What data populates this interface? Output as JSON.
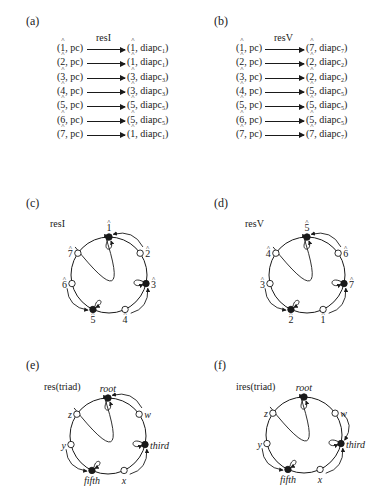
{
  "panels": {
    "a": {
      "label": "(a)",
      "title": "resI",
      "rows": [
        {
          "src": "1",
          "src_tag": "pc",
          "dst": "1",
          "dst_tag": "diapc",
          "dst_sub": "1"
        },
        {
          "src": "2",
          "src_tag": "pc",
          "dst": "1",
          "dst_tag": "diapc",
          "dst_sub": "1"
        },
        {
          "src": "3",
          "src_tag": "pc",
          "dst": "3",
          "dst_tag": "diapc",
          "dst_sub": "3"
        },
        {
          "src": "4",
          "src_tag": "pc",
          "dst": "3",
          "dst_tag": "diapc",
          "dst_sub": "3"
        },
        {
          "src": "5",
          "src_tag": "pc",
          "dst": "5",
          "dst_tag": "diapc",
          "dst_sub": "5"
        },
        {
          "src": "6",
          "src_tag": "pc",
          "dst": "5",
          "dst_tag": "diapc",
          "dst_sub": "5"
        },
        {
          "src": "7",
          "src_tag": "pc",
          "dst": "1",
          "dst_tag": "diapc",
          "dst_sub": "1"
        }
      ]
    },
    "b": {
      "label": "(b)",
      "title": "resV",
      "rows": [
        {
          "src": "1",
          "src_tag": "pc",
          "dst": "7",
          "dst_tag": "diapc",
          "dst_sub": "7"
        },
        {
          "src": "2",
          "src_tag": "pc",
          "dst": "2",
          "dst_tag": "diapc",
          "dst_sub": "2"
        },
        {
          "src": "3",
          "src_tag": "pc",
          "dst": "2",
          "dst_tag": "diapc",
          "dst_sub": "2"
        },
        {
          "src": "4",
          "src_tag": "pc",
          "dst": "5",
          "dst_tag": "diapc",
          "dst_sub": "5"
        },
        {
          "src": "5",
          "src_tag": "pc",
          "dst": "5",
          "dst_tag": "diapc",
          "dst_sub": "5"
        },
        {
          "src": "6",
          "src_tag": "pc",
          "dst": "5",
          "dst_tag": "diapc",
          "dst_sub": "5"
        },
        {
          "src": "7",
          "src_tag": "pc",
          "dst": "7",
          "dst_tag": "diapc",
          "dst_sub": "7"
        }
      ]
    },
    "c": {
      "label": "(c)",
      "title": "resI",
      "nodes": [
        {
          "label": "1",
          "filled": true,
          "hat": true
        },
        {
          "label": "2",
          "filled": false,
          "hat": true
        },
        {
          "label": "3",
          "filled": true,
          "hat": true
        },
        {
          "label": "4",
          "filled": false,
          "hat": true
        },
        {
          "label": "5",
          "filled": true,
          "hat": true
        },
        {
          "label": "6",
          "filled": false,
          "hat": true
        },
        {
          "label": "7",
          "filled": false,
          "hat": true
        }
      ],
      "edges": [
        [
          "7",
          "1"
        ],
        [
          "2",
          "1"
        ],
        [
          "1",
          "1"
        ],
        [
          "3",
          "3"
        ],
        [
          "4",
          "3"
        ],
        [
          "5",
          "5"
        ],
        [
          "6",
          "5"
        ]
      ]
    },
    "d": {
      "label": "(d)",
      "title": "resV",
      "nodes": [
        {
          "label": "5",
          "filled": true,
          "hat": true
        },
        {
          "label": "6",
          "filled": false,
          "hat": true
        },
        {
          "label": "7",
          "filled": true,
          "hat": true
        },
        {
          "label": "1",
          "filled": false,
          "hat": true
        },
        {
          "label": "2",
          "filled": true,
          "hat": true
        },
        {
          "label": "3",
          "filled": false,
          "hat": true
        },
        {
          "label": "4",
          "filled": false,
          "hat": true
        }
      ],
      "edges": [
        [
          "4",
          "5"
        ],
        [
          "6",
          "5"
        ],
        [
          "5",
          "5"
        ],
        [
          "7",
          "7"
        ],
        [
          "1",
          "7"
        ],
        [
          "2",
          "2"
        ],
        [
          "3",
          "2"
        ]
      ]
    },
    "e": {
      "label": "(e)",
      "title": "res(triad)",
      "nodes": [
        {
          "label": "root",
          "filled": true
        },
        {
          "label": "w",
          "filled": false
        },
        {
          "label": "third",
          "filled": true
        },
        {
          "label": "x",
          "filled": false
        },
        {
          "label": "fifth",
          "filled": true
        },
        {
          "label": "y",
          "filled": false
        },
        {
          "label": "z",
          "filled": false
        }
      ],
      "edges": [
        [
          "z",
          "root"
        ],
        [
          "w",
          "root"
        ],
        [
          "root",
          "root"
        ],
        [
          "third",
          "third"
        ],
        [
          "x",
          "third"
        ],
        [
          "fifth",
          "fifth"
        ],
        [
          "y",
          "fifth"
        ]
      ]
    },
    "f": {
      "label": "(f)",
      "title": "ires(triad)",
      "nodes": [
        {
          "label": "root",
          "filled": true
        },
        {
          "label": "w",
          "filled": false
        },
        {
          "label": "third",
          "filled": true
        },
        {
          "label": "x",
          "filled": false
        },
        {
          "label": "fifth",
          "filled": true
        },
        {
          "label": "y",
          "filled": false
        },
        {
          "label": "z",
          "filled": false
        }
      ],
      "edges": [
        [
          "z",
          "root"
        ],
        [
          "root",
          "root"
        ],
        [
          "w",
          "third"
        ],
        [
          "third",
          "third"
        ],
        [
          "x",
          "third"
        ],
        [
          "fifth",
          "fifth"
        ],
        [
          "y",
          "fifth"
        ]
      ]
    }
  }
}
